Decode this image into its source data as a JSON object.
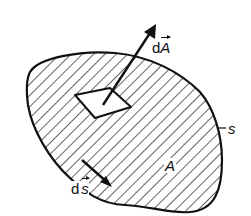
{
  "diagram": {
    "labels": {
      "area_element": {
        "prefix": "d",
        "symbol": "A"
      },
      "line_element": {
        "prefix": "d",
        "symbol": "s"
      },
      "area": "A",
      "boundary": "s"
    },
    "colors": {
      "stroke": "#111111",
      "background": "#ffffff"
    }
  }
}
